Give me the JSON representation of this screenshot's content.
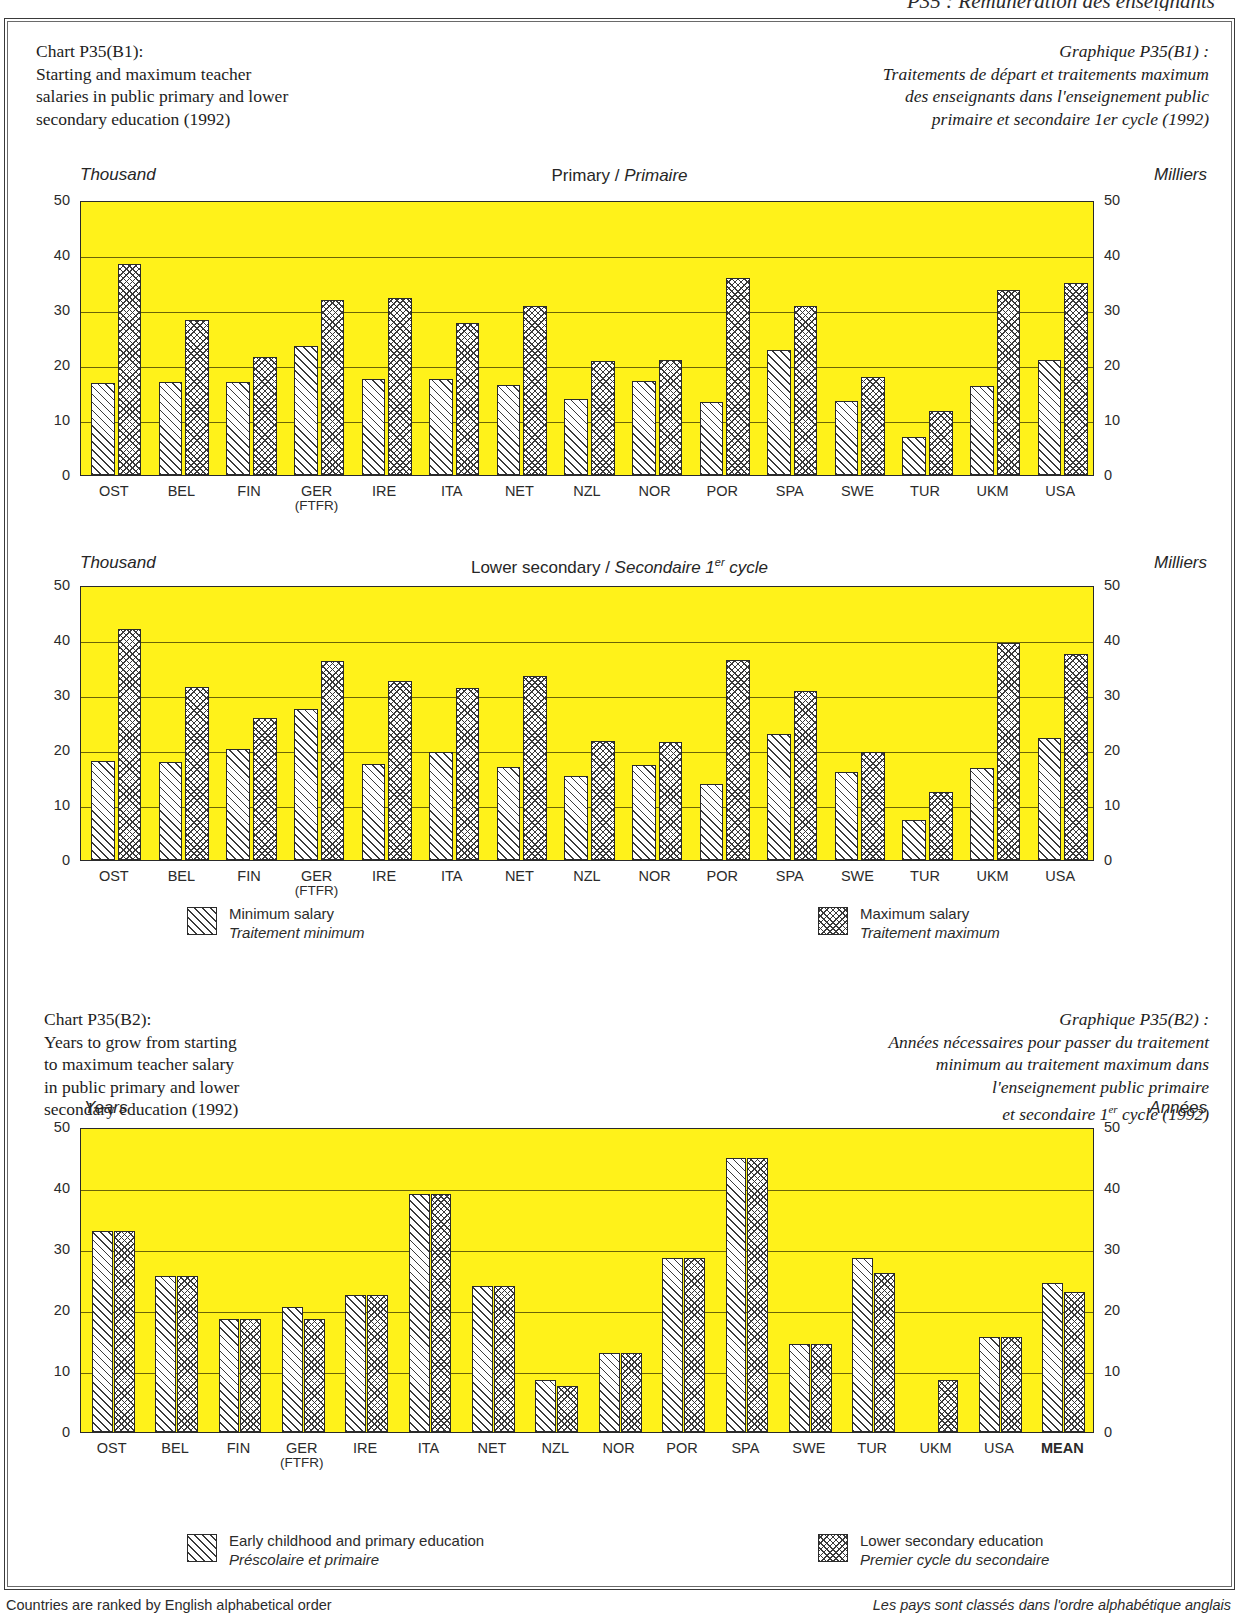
{
  "page": {
    "running_header": "P35 : Rémunération des enseignants",
    "footer_en": "Countries are ranked by English alphabetical order",
    "footer_fr": "Les pays sont classés dans l'ordre alphabétique anglais",
    "colors": {
      "plot_fill": "#FFF21A",
      "gridline": "#6b6406",
      "ink": "#2b2b2b"
    }
  },
  "chart_b1": {
    "title_en": {
      "l1": "Chart P35(B1):",
      "l2": "Starting and maximum teacher",
      "l3": "salaries in public primary and lower",
      "l4": "secondary education (1992)"
    },
    "title_fr": {
      "l1": "Graphique P35(B1) :",
      "l2": "Traitements de départ et traitements maximum",
      "l3": "des enseignants dans l'enseignement public",
      "l4": "primaire et secondaire 1er cycle (1992)"
    },
    "legend": {
      "min_en": "Minimum salary",
      "min_fr": "Traitement minimum",
      "max_en": "Maximum salary",
      "max_fr": "Traitement maximum"
    }
  },
  "chart_b2": {
    "title_en": {
      "l1": "Chart P35(B2):",
      "l2": "Years to grow from starting",
      "l3": "to maximum teacher salary",
      "l4": "in public primary and lower",
      "l5": "secondary education (1992)"
    },
    "title_fr": {
      "l1": "Graphique P35(B2) :",
      "l2": "Années nécessaires pour passer du traitement",
      "l3": "minimum au traitement maximum dans",
      "l4": "l'enseignement public primaire",
      "l5": "et secondaire 1er cycle (1992)"
    },
    "legend": {
      "primary_en": "Early childhood and primary education",
      "primary_fr": "Préscolaire et primaire",
      "lower_en": "Lower secondary education",
      "lower_fr": "Premier cycle du secondaire"
    }
  },
  "chart_data": [
    {
      "id": "primary",
      "type": "bar",
      "title": "Primary / Primaire",
      "title_en": "Primary",
      "title_fr": "Primaire",
      "ylabel_left": "Thousand",
      "ylabel_right": "Milliers",
      "ylim": [
        0,
        50
      ],
      "yticks": [
        0,
        10,
        20,
        30,
        40,
        50
      ],
      "grid": true,
      "legend_position": "below",
      "categories": [
        "OST",
        "BEL",
        "FIN",
        "GER",
        "IRE",
        "ITA",
        "NET",
        "NZL",
        "NOR",
        "POR",
        "SPA",
        "SWE",
        "TUR",
        "UKM",
        "USA"
      ],
      "category_sublabels": [
        "",
        "",
        "",
        "(FTFR)",
        "",
        "",
        "",
        "",
        "",
        "",
        "",
        "",
        "",
        "",
        ""
      ],
      "series": [
        {
          "name": "Minimum salary",
          "pattern": "hatch",
          "values": [
            16.8,
            16.9,
            16.9,
            23.4,
            17.4,
            17.4,
            16.4,
            13.8,
            17.1,
            13.3,
            22.8,
            13.4,
            6.9,
            16.1,
            21.0
          ]
        },
        {
          "name": "Maximum salary",
          "pattern": "check",
          "values": [
            38.3,
            28.2,
            21.4,
            31.9,
            32.1,
            27.7,
            30.8,
            20.7,
            20.9,
            35.8,
            30.8,
            17.9,
            11.6,
            33.7,
            35.0
          ]
        }
      ]
    },
    {
      "id": "lower_secondary",
      "type": "bar",
      "title": "Lower secondary / Secondaire 1er cycle",
      "title_en": "Lower secondary",
      "title_fr": "Secondaire 1er cycle",
      "ylabel_left": "Thousand",
      "ylabel_right": "Milliers",
      "ylim": [
        0,
        50
      ],
      "yticks": [
        0,
        10,
        20,
        30,
        40,
        50
      ],
      "grid": true,
      "legend_position": "below",
      "categories": [
        "OST",
        "BEL",
        "FIN",
        "GER",
        "IRE",
        "ITA",
        "NET",
        "NZL",
        "NOR",
        "POR",
        "SPA",
        "SWE",
        "TUR",
        "UKM",
        "USA"
      ],
      "category_sublabels": [
        "",
        "",
        "",
        "(FTFR)",
        "",
        "",
        "",
        "",
        "",
        "",
        "",
        "",
        "",
        "",
        ""
      ],
      "series": [
        {
          "name": "Minimum salary",
          "pattern": "hatch",
          "values": [
            18.0,
            17.9,
            20.2,
            27.4,
            17.5,
            19.7,
            17.0,
            15.2,
            17.3,
            13.8,
            22.9,
            16.0,
            7.3,
            16.8,
            22.1
          ]
        },
        {
          "name": "Maximum salary",
          "pattern": "check",
          "values": [
            42.0,
            31.4,
            25.8,
            36.2,
            32.5,
            31.3,
            33.5,
            21.7,
            21.4,
            36.4,
            30.7,
            19.7,
            12.3,
            39.5,
            37.5
          ]
        }
      ]
    },
    {
      "id": "years_to_max",
      "type": "bar",
      "title": "Years / Années",
      "ylabel_left": "Years",
      "ylabel_right": "Années",
      "ylim": [
        0,
        50
      ],
      "yticks": [
        0,
        10,
        20,
        30,
        40,
        50
      ],
      "grid": true,
      "legend_position": "below",
      "categories": [
        "OST",
        "BEL",
        "FIN",
        "GER",
        "IRE",
        "ITA",
        "NET",
        "NZL",
        "NOR",
        "POR",
        "SPA",
        "SWE",
        "TUR",
        "UKM",
        "USA",
        "MEAN"
      ],
      "category_sublabels": [
        "",
        "",
        "",
        "(FTFR)",
        "",
        "",
        "",
        "",
        "",
        "",
        "",
        "",
        "",
        "",
        "",
        ""
      ],
      "series": [
        {
          "name": "Early childhood and primary education",
          "pattern": "hatch",
          "values": [
            33,
            25.5,
            18.5,
            20.5,
            22.5,
            39,
            24,
            8.5,
            13,
            28.5,
            45,
            14.5,
            28.5,
            null,
            15.5,
            24.5
          ]
        },
        {
          "name": "Lower secondary education",
          "pattern": "check",
          "values": [
            33,
            25.5,
            18.5,
            18.5,
            22.5,
            39,
            24,
            7.5,
            13,
            28.5,
            45,
            14.5,
            26,
            8.5,
            15.5,
            23
          ]
        }
      ]
    }
  ]
}
